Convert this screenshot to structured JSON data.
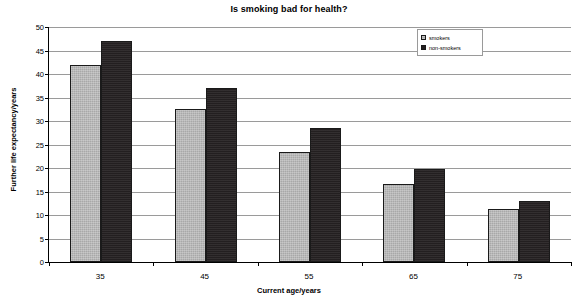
{
  "chart_data": {
    "type": "bar",
    "title": "Is smoking bad for health?",
    "xlabel": "Current age/years",
    "ylabel": "Further life expectancy/years",
    "categories": [
      "35",
      "45",
      "55",
      "65",
      "75"
    ],
    "series": [
      {
        "name": "smokers",
        "values": [
          42,
          32.5,
          23.5,
          16.5,
          11.3
        ],
        "color": "#a8a8a8"
      },
      {
        "name": "non-smokers",
        "values": [
          47,
          37,
          28.5,
          19.8,
          13
        ],
        "color": "#231f20"
      }
    ],
    "ylim": [
      0,
      50
    ],
    "yticks": [
      0,
      5,
      10,
      15,
      20,
      25,
      30,
      35,
      40,
      45,
      50
    ],
    "ytick_labels": [
      "0",
      "5",
      "10",
      "15",
      "20",
      "25",
      "30",
      "35",
      "40",
      "45",
      "50"
    ],
    "grid": true,
    "legend_position": "top-right"
  },
  "legend": {
    "entries": [
      {
        "label": "smokers"
      },
      {
        "label": "non-smokers"
      }
    ]
  }
}
